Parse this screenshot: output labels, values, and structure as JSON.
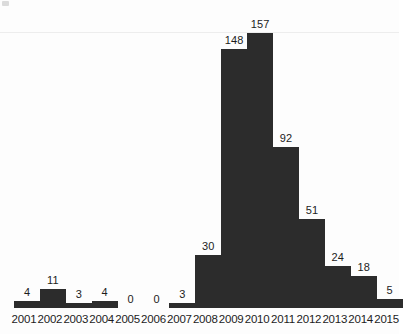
{
  "chart_data": {
    "type": "bar",
    "title": "",
    "subtitle": "",
    "xlabel": "",
    "ylabel": "",
    "grid": false,
    "legend": null,
    "ylim": [
      0,
      157
    ],
    "bar_color": "#2c2c2c",
    "label_color": "#1c1c1c",
    "background": "#fdfdfd",
    "categories": [
      "2001",
      "2002",
      "2003",
      "2004",
      "2005",
      "2006",
      "2007",
      "2008",
      "2009",
      "2010",
      "2011",
      "2012",
      "2013",
      "2014",
      "2015"
    ],
    "values": [
      4,
      11,
      3,
      4,
      0,
      0,
      3,
      30,
      148,
      157,
      92,
      51,
      24,
      18,
      5
    ],
    "value_labels": [
      "4",
      "11",
      "3",
      "4",
      "0",
      "0",
      "3",
      "30",
      "148",
      "157",
      "92",
      "51",
      "24",
      "18",
      "5"
    ]
  },
  "axis": {
    "x_ticks": [
      "2001",
      "2002",
      "2003",
      "2004",
      "2005",
      "2006",
      "2007",
      "2008",
      "2009",
      "2010",
      "2011",
      "2012",
      "2013",
      "2014",
      "2015"
    ]
  }
}
